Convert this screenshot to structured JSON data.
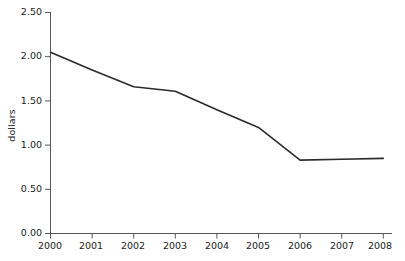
{
  "chart_data": {
    "type": "line",
    "title": "",
    "xlabel": "",
    "ylabel": "dollars",
    "x": [
      2000,
      2001,
      2002,
      2003,
      2004,
      2005,
      2006,
      2007,
      2008
    ],
    "categories": [
      "2000",
      "2001",
      "2002",
      "2003",
      "2004",
      "2005",
      "2006",
      "2007",
      "2008"
    ],
    "values": [
      2.05,
      1.85,
      1.66,
      1.61,
      1.4,
      1.2,
      0.83,
      0.84,
      0.85
    ],
    "series": [
      {
        "name": "dollars",
        "values": [
          2.05,
          1.85,
          1.66,
          1.61,
          1.4,
          1.2,
          0.83,
          0.84,
          0.85
        ],
        "color": "#2b2b2b"
      }
    ],
    "ylim": [
      0.0,
      2.5
    ],
    "xlim": [
      2000,
      2008
    ],
    "yticks": [
      0.0,
      0.5,
      1.0,
      1.5,
      2.0,
      2.5
    ],
    "ytick_labels": [
      "0.00",
      "0.50",
      "1.00",
      "1.50",
      "2.00",
      "2.50"
    ],
    "xtick_labels": [
      "2000",
      "2001",
      "2002",
      "2003",
      "2004",
      "2005",
      "2006",
      "2007",
      "2008"
    ],
    "grid": false,
    "legend": false,
    "legend_position": "none",
    "line_color": "#2b2b2b",
    "axis_color": "#555555",
    "background_color": "#ffffff",
    "markers": false
  },
  "axes": {
    "y_axis_title": "dollars",
    "y_tick_labels": [
      "2.50",
      "2.00",
      "1.50",
      "1.00",
      "0.50",
      "0.00"
    ],
    "x_tick_labels": [
      "2000",
      "2001",
      "2002",
      "2003",
      "2004",
      "2005",
      "2006",
      "2007",
      "2008"
    ]
  }
}
